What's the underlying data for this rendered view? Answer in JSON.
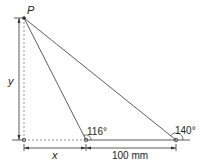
{
  "diagram": {
    "point_label": "P",
    "height_label": "y",
    "base_label": "x",
    "distance_label": "100 mm",
    "angle_near": "116°",
    "angle_far": "140°"
  },
  "colors": {
    "line": "#333333",
    "dashed": "#777777",
    "text": "#222222"
  }
}
